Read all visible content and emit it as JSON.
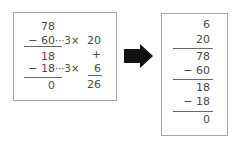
{
  "left_panel": {
    "dividend": "78",
    "step1_subtract": "− 60",
    "step1_note": "···3×",
    "step1_quotient_part": "20",
    "plus_sign": "+",
    "remainder1": "18",
    "step2_subtract": "− 18",
    "step2_note": "···3×",
    "step2_quotient_part": "6",
    "remainder_final": "0",
    "quotient_total": "26"
  },
  "arrow": {
    "icon": "right-arrow-icon",
    "color": "#111111"
  },
  "right_panel": {
    "partial_quotients": [
      "6",
      "20"
    ],
    "dividend": "78",
    "step1_subtract": "− 60",
    "remainder1": "18",
    "step2_subtract": "− 18",
    "remainder_final": "0"
  }
}
